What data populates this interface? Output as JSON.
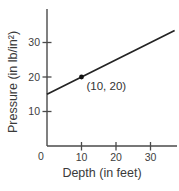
{
  "chart_data": {
    "type": "line",
    "title": "",
    "xlabel": "Depth (in feet)",
    "ylabel": "Pressure (in lb/in²)",
    "xlim": [
      0,
      37
    ],
    "ylim": [
      0,
      40
    ],
    "x_ticks": [
      10,
      20,
      30
    ],
    "y_ticks": [
      10,
      20,
      30
    ],
    "origin_label": "0",
    "grid": false,
    "legend": "none",
    "series": [
      {
        "name": "pressure-vs-depth",
        "model": "pressure = 15 + 0.5 * depth",
        "slope": 0.5,
        "intercept": 15,
        "x_domain": [
          0,
          37
        ],
        "points": [
          [
            0,
            15
          ],
          [
            10,
            20
          ],
          [
            20,
            25
          ],
          [
            30,
            30
          ],
          [
            37,
            33.5
          ]
        ]
      }
    ],
    "annotated_point": {
      "x": 10,
      "y": 20,
      "label": "(10, 20)"
    }
  }
}
